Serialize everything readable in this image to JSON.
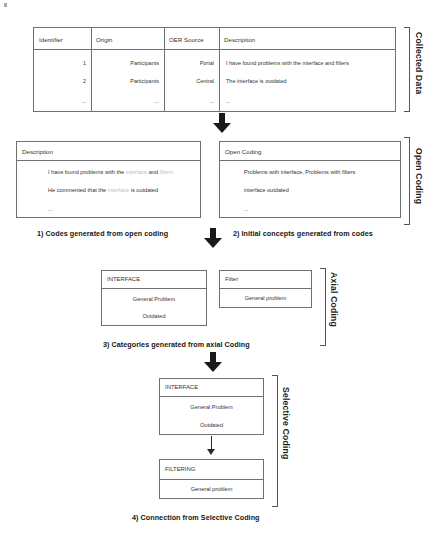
{
  "diagram": {
    "stages": [
      "Collected Data",
      "Open Coding",
      "Axial Coding",
      "Selective Coding"
    ]
  },
  "collected_data": {
    "bracket_label": "Collected Data",
    "table": {
      "headers": [
        "Identifier",
        "Origin",
        "OER Source",
        "Description"
      ],
      "rows": [
        [
          "1",
          "Participants",
          "Portal",
          "I have found problems with the interface and filters"
        ],
        [
          "2",
          "Participants",
          "Central",
          "The interface is outdated"
        ],
        [
          "...",
          "...",
          "...",
          "..."
        ]
      ]
    }
  },
  "open_coding": {
    "bracket_label": "Open Coding",
    "left_panel": {
      "title": "Description",
      "lines": [
        [
          {
            "t": "I have found problems with the ",
            "h": false
          },
          {
            "t": "interface",
            "h": true
          },
          {
            "t": " and ",
            "h": false
          },
          {
            "t": "filters",
            "h": true
          }
        ],
        [
          {
            "t": "He commented that the ",
            "h": false
          },
          {
            "t": "interface",
            "h": true
          },
          {
            "t": " is outdated",
            "h": false
          }
        ],
        [
          {
            "t": "...",
            "h": false
          }
        ]
      ]
    },
    "right_panel": {
      "title": "Open Coding",
      "lines": [
        [
          {
            "t": "Problems with interface, Problems with filters",
            "h": false
          }
        ],
        [
          {
            "t": "interface outdated",
            "h": false
          }
        ],
        [
          {
            "t": "...",
            "h": false
          }
        ]
      ]
    },
    "caption_left": "1) Codes generated from open coding",
    "caption_right": "2) Initial concepts generated from codes"
  },
  "axial_coding": {
    "bracket_label": "Axial Coding",
    "cards": [
      {
        "title": "INTERFACE",
        "items": [
          "General Problem",
          "Outdated"
        ]
      },
      {
        "title": "Filter",
        "items": [
          "General problem"
        ]
      }
    ],
    "caption": "3) Categories generated from axial Coding"
  },
  "selective_coding": {
    "bracket_label": "Selective Coding",
    "cards": [
      {
        "title": "INTERFACE",
        "items": [
          "General Problem",
          "Outdated"
        ]
      },
      {
        "title": "FILTERING",
        "items": [
          "General problem"
        ]
      }
    ],
    "caption": "4) Connection from Selective Coding"
  },
  "colors": {
    "line": "#6f6f6f",
    "text": "#333333",
    "highlight": "#b7c3d4",
    "arrow": "#1a1a1a"
  }
}
